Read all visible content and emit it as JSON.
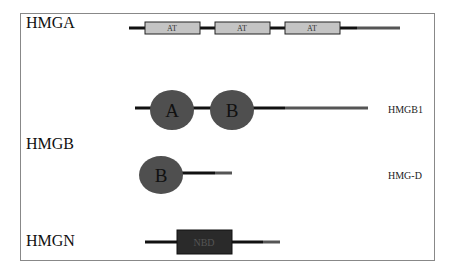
{
  "families": [
    {
      "name": "HMGA",
      "domains": [
        "AT",
        "AT",
        "AT"
      ]
    },
    {
      "name": "HMGB",
      "proteins": [
        {
          "name": "HMGB1",
          "domains": [
            "A",
            "B"
          ]
        },
        {
          "name": "HMG-D",
          "domains": [
            "B"
          ]
        }
      ]
    },
    {
      "name": "HMGN",
      "domains": [
        "NBD"
      ]
    }
  ],
  "colors": {
    "backbone": "#111111",
    "tail": "#555555",
    "at_box": "#c4c4c4",
    "hmg_box": "#4f4f4f",
    "nbd": "#2a2a2a"
  }
}
